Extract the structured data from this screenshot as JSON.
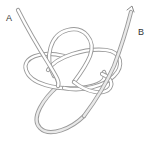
{
  "diagram": {
    "type": "knot-illustration",
    "labels": {
      "a": "A",
      "b": "B"
    },
    "colors": {
      "rope_outline": "#9a9a9a",
      "rope_fill": "#ffffff",
      "tail_fill": "#e9e9e9",
      "label_text": "#333333",
      "background": "#ffffff"
    }
  }
}
